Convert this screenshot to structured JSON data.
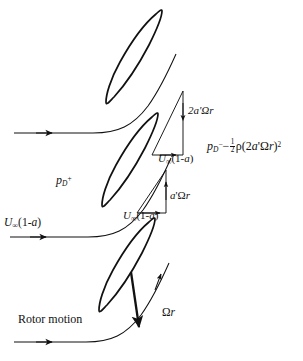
{
  "figure": {
    "type": "diagram",
    "background_color": "#ffffff",
    "line_color": "#111111",
    "width": 303,
    "height": 361
  },
  "labels": {
    "upper_tangential_velocity": {
      "text": "2a'Ωr",
      "parts": {
        "coefficient": "2",
        "induction": "a'",
        "omega": "Ω",
        "radius": "r"
      },
      "x": 188,
      "y": 112
    },
    "upper_axial_velocity": {
      "text": "U∞(1-a)",
      "x": 166,
      "y": 160
    },
    "lower_tangential_velocity": {
      "text": "a'Ωr",
      "x": 171,
      "y": 197
    },
    "lower_axial_velocity": {
      "text": "U∞(1-a)",
      "x": 131,
      "y": 213
    },
    "pressure_upstream": {
      "text": "p_D+",
      "base": "p",
      "subscript": "D",
      "superscript": "+",
      "x": 56,
      "y": 179
    },
    "pressure_downstream": {
      "text": "p_D− − ½ρ(2a'Ωr)²",
      "base": "p",
      "subscript": "D",
      "superscript": "−",
      "minus": "−",
      "fraction_numerator": "1",
      "fraction_denominator": "2",
      "rho": "ρ",
      "bracket_open": "(",
      "inner": "2a'Ωr",
      "bracket_close": ")",
      "exponent": "2",
      "x": 209,
      "y": 144
    },
    "freestream_inflow": {
      "text": "U∞(1-a)",
      "x": 4,
      "y": 222
    },
    "rotor_motion": {
      "text": "Rotor motion",
      "x": 18,
      "y": 319
    },
    "blade_speed": {
      "text": "Ωr",
      "x": 163,
      "y": 313
    }
  },
  "elements": {
    "blades": [
      {
        "name": "blade-upper",
        "position": "top"
      },
      {
        "name": "blade-middle",
        "position": "middle"
      },
      {
        "name": "blade-lower",
        "position": "bottom"
      }
    ],
    "streamlines": [
      {
        "name": "streamline-upper",
        "has_arrowhead": true
      },
      {
        "name": "streamline-middle",
        "has_arrowhead": true
      },
      {
        "name": "streamline-lower",
        "has_arrowhead": true
      }
    ],
    "velocity_triangles": [
      {
        "name": "velocity-triangle-upper",
        "vertical_label": "2a'Ωr",
        "horizontal_label": "U∞(1-a)"
      },
      {
        "name": "velocity-triangle-lower",
        "vertical_label": "a'Ωr",
        "horizontal_label": "U∞(1-a)"
      }
    ],
    "arrows": [
      {
        "name": "rotor-motion-arrow",
        "direction": "right"
      },
      {
        "name": "blade-speed-arrow",
        "direction": "down",
        "label": "Ωr"
      },
      {
        "name": "wake-up-arrow",
        "direction": "up"
      }
    ]
  }
}
